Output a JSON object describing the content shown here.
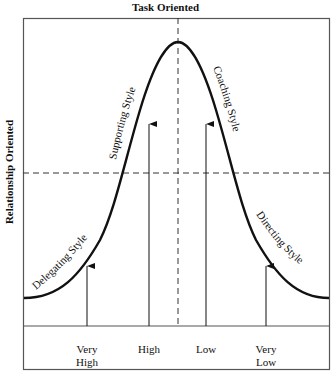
{
  "diagram": {
    "title": "Task Oriented",
    "y_axis_label": "Relationship Oriented",
    "curve_labels": {
      "delegating": "Delegating Style",
      "supporting": "Supporting Style",
      "coaching": "Coaching Style",
      "directing": "Directing Style"
    },
    "maturity_levels": [
      {
        "line1": "Very",
        "line2": "High"
      },
      {
        "line1": "High",
        "line2": ""
      },
      {
        "line1": "Low",
        "line2": ""
      },
      {
        "line1": "Very",
        "line2": "Low"
      }
    ],
    "colors": {
      "line": "#111111",
      "frame": "#555555",
      "background": "#ffffff"
    }
  }
}
